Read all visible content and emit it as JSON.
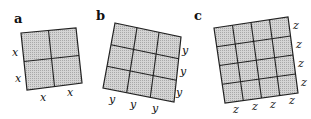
{
  "panels": [
    {
      "label": "a",
      "grid": 2,
      "side_label": "x",
      "side_count": 2
    },
    {
      "label": "b",
      "grid": 3,
      "side_label": "y",
      "side_count": 3
    },
    {
      "label": "c",
      "grid": 4,
      "side_label": "z",
      "side_count": 4
    }
  ],
  "colors": {
    "fill": "#c9c9c9",
    "stroke": "#222222",
    "text": "#111111"
  }
}
